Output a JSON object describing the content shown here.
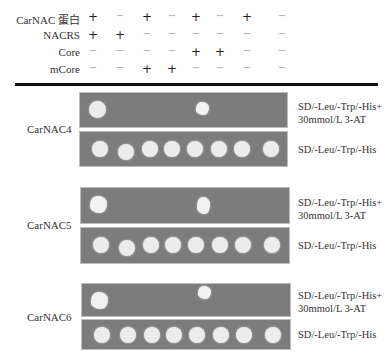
{
  "header": {
    "rows": [
      {
        "label": "CarNAC 蛋白",
        "signs": [
          "+",
          "−",
          "+",
          "−",
          "+",
          "−",
          "+",
          "−"
        ]
      },
      {
        "label": "NACRS",
        "signs": [
          "+",
          "+",
          "−",
          "−",
          "−",
          "−",
          "−",
          "−"
        ]
      },
      {
        "label": "Core",
        "signs": [
          "−",
          "−",
          "−",
          "−",
          "+",
          "+",
          "−",
          "−"
        ]
      },
      {
        "label": "mCore",
        "signs": [
          "−",
          "−",
          "+",
          "+",
          "−",
          "−",
          "−",
          "−"
        ]
      }
    ]
  },
  "conditions": {
    "selective_line1": "SD/-Leu/-Trp/-His+",
    "selective_line2": "30mmol/L 3-AT",
    "control": "SD/-Leu/-Trp/-His"
  },
  "panels": [
    {
      "name": "CarNAC4",
      "selective_growth": [
        1,
        0,
        0,
        0,
        1,
        0,
        0,
        0
      ],
      "control_growth": [
        1,
        1,
        1,
        1,
        1,
        1,
        1,
        1
      ]
    },
    {
      "name": "CarNAC5",
      "selective_growth": [
        1,
        0,
        0,
        0,
        1,
        0,
        0,
        0
      ],
      "control_growth": [
        1,
        1,
        1,
        1,
        1,
        1,
        1,
        1
      ]
    },
    {
      "name": "CarNAC6",
      "selective_growth": [
        1,
        0,
        0,
        0,
        1,
        0,
        0,
        0
      ],
      "control_growth": [
        1,
        1,
        1,
        1,
        1,
        1,
        1,
        1
      ]
    }
  ]
}
